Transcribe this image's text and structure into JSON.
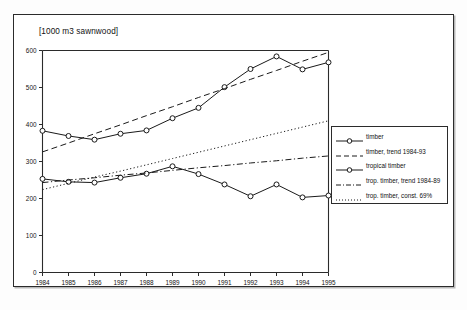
{
  "figure": {
    "axis_unit_label": "[1000 m3 sawnwood]",
    "background_color": "#ffffff",
    "line_color": "#1a1a1a",
    "frame_color": "#2b2b2b"
  },
  "legend": {
    "position": "right-middle",
    "items": [
      {
        "label": "timber",
        "style": "solid-with-circle-markers"
      },
      {
        "label": "timber, trend 1984-93",
        "style": "dashed"
      },
      {
        "label": "tropical timber",
        "style": "solid-with-circle-markers"
      },
      {
        "label": "trop. timber, trend 1984-89",
        "style": "dash-dot"
      },
      {
        "label": "trop. timber, const. 69%",
        "style": "dotted"
      }
    ]
  },
  "chart_data": {
    "type": "line",
    "title": "",
    "xlabel": "",
    "ylabel": "[1000 m3 sawnwood]",
    "xlim": [
      1984,
      1995
    ],
    "ylim": [
      0,
      600
    ],
    "yticks": [
      0,
      100,
      200,
      300,
      400,
      500,
      600
    ],
    "grid": false,
    "legend_position": "right",
    "categories": [
      1984,
      1985,
      1986,
      1987,
      1988,
      1989,
      1990,
      1991,
      1992,
      1993,
      1994,
      1995
    ],
    "x": [
      "1984",
      "1985",
      "1986",
      "1987",
      "1988",
      "1989",
      "1990",
      "1991",
      "1992",
      "1993",
      "1994",
      "1995"
    ],
    "series": [
      {
        "name": "timber",
        "style": "solid",
        "marker": "circle",
        "values": [
          383,
          369,
          359,
          375,
          384,
          417,
          445,
          501,
          550,
          584,
          549,
          568
        ]
      },
      {
        "name": "timber, trend 1984-93",
        "style": "dashed",
        "marker": "none",
        "values": [
          326,
          350,
          375,
          399,
          424,
          448,
          473,
          497,
          522,
          546,
          571,
          595
        ]
      },
      {
        "name": "tropical timber",
        "style": "solid",
        "marker": "circle",
        "values": [
          253,
          245,
          243,
          256,
          267,
          287,
          266,
          238,
          206,
          238,
          203,
          208
        ]
      },
      {
        "name": "trop. timber, trend 1984-89",
        "style": "dash-dot",
        "marker": "none",
        "values": [
          243,
          250,
          256,
          263,
          269,
          276,
          283,
          289,
          296,
          302,
          309,
          315
        ]
      },
      {
        "name": "trop. timber, const. 69%",
        "style": "dotted",
        "marker": "none",
        "values": [
          224,
          241,
          258,
          274,
          291,
          308,
          325,
          342,
          359,
          376,
          393,
          410
        ]
      }
    ]
  }
}
